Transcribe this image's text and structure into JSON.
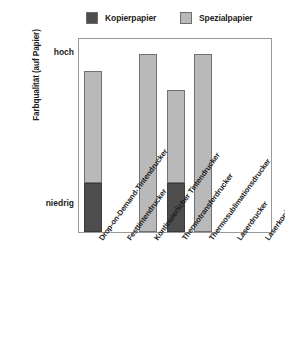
{
  "chart_data": {
    "type": "bar",
    "title": "",
    "subtitle": "",
    "xlabel": "",
    "ylabel": "Farbqualität (auf Papier)",
    "grid": false,
    "legend_position": "top",
    "ytick_labels": [
      "niedrig",
      "hoch"
    ],
    "ylim": [
      0,
      100
    ],
    "categories": [
      "Drop-on-Demand-Tintendrucker",
      "Festtintendrucker",
      "Kontinuierlicher Tintendrucker",
      "Thermotransferdrucker",
      "Thermosublimationsdrucker",
      "Laserdrucker",
      "Laserkopierer"
    ],
    "series": [
      {
        "name": "Kopierpapier",
        "color": "#4d4d4d",
        "values": [
          26,
          75,
          0,
          26,
          0,
          75,
          75
        ]
      },
      {
        "name": "Spezialpapier",
        "color": "#b9b9b9",
        "values": [
          85,
          0,
          94,
          75,
          94,
          0,
          0
        ]
      }
    ],
    "bars": [
      {
        "category": "Drop-on-Demand-Tintendrucker",
        "top_value": 85,
        "split_value": 26,
        "top_series": "Spezialpapier",
        "bottom_series": "Kopierpapier"
      },
      {
        "category": "Festtintendrucker",
        "top_value": 75,
        "split_value": 75,
        "top_series": "Kopierpapier",
        "bottom_series": "Kopierpapier"
      },
      {
        "category": "Kontinuierlicher Tintendrucker",
        "top_value": 94,
        "split_value": 0,
        "top_series": "Spezialpapier",
        "bottom_series": "Spezialpapier"
      },
      {
        "category": "Thermotransferdrucker",
        "top_value": 75,
        "split_value": 26,
        "top_series": "Spezialpapier",
        "bottom_series": "Kopierpapier"
      },
      {
        "category": "Thermosublimationsdrucker",
        "top_value": 94,
        "split_value": 0,
        "top_series": "Spezialpapier",
        "bottom_series": "Spezialpapier"
      },
      {
        "category": "Laserdrucker",
        "top_value": 75,
        "split_value": 75,
        "top_series": "Kopierpapier",
        "bottom_series": "Kopierpapier"
      },
      {
        "category": "Laserkopierer",
        "top_value": 75,
        "split_value": 75,
        "top_series": "Kopierpapier",
        "bottom_series": "Kopierpapier"
      }
    ]
  },
  "legend": {
    "items": [
      {
        "label": "Kopierpapier",
        "color": "#4d4d4d"
      },
      {
        "label": "Spezialpapier",
        "color": "#b9b9b9"
      }
    ]
  },
  "axis": {
    "y_title": "Farbqualität (auf Papier)",
    "tick_high": "hoch",
    "tick_low": "niedrig"
  },
  "colors": {
    "dark": "#4d4d4d",
    "light": "#b9b9b9",
    "frame": "#9a9a9a",
    "text": "#1c1c1c",
    "background": "#ffffff"
  }
}
